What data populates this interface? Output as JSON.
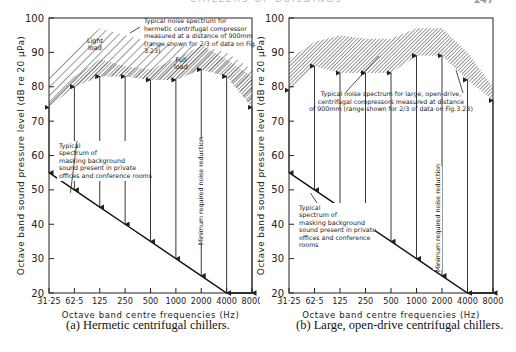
{
  "page": {
    "header_text": "CHILLERS OF BUILDINGS",
    "page_number": "147"
  },
  "chart_data": [
    {
      "type": "line",
      "panel": "a",
      "title": "(a) Hermetic centrifugal chillers.",
      "xlabel": "Octave band centre frequencies (Hz)",
      "ylabel": "Octave band sound pressure level (dB re 20 μPa)",
      "ylim": [
        20,
        100
      ],
      "yticks": [
        20,
        30,
        40,
        50,
        60,
        70,
        80,
        90,
        100
      ],
      "categories": [
        "31·25",
        "62·5",
        "125",
        "250",
        "500",
        "1000",
        "2000",
        "4000",
        "8000"
      ],
      "series": [
        {
          "name": "Light load noise spectrum (upper bound)",
          "values": [
            83,
            91,
            97,
            95,
            93,
            92,
            92,
            90,
            85
          ]
        },
        {
          "name": "Full load noise spectrum (upper bound)",
          "values": [
            76,
            83,
            88,
            86,
            85,
            88,
            92,
            88,
            83
          ]
        },
        {
          "name": "Full load noise spectrum (lower bound, arrow tips)",
          "values": [
            74,
            80,
            83,
            83,
            82,
            82,
            85,
            83,
            74
          ]
        },
        {
          "name": "Typical spectrum of masking background sound",
          "values": [
            55,
            50,
            45,
            40,
            35,
            30,
            25,
            20,
            20
          ]
        }
      ],
      "annotations": [
        "Typical noise spectrum for hermetic centrifugal compressor measured at a distance of 900mm (range shown for 2/3 of data on Fig. 3.23)",
        "Light load",
        "Full load",
        "Typical spectrum of masking background sound present in private offices and conference rooms",
        "Minimum required noise reduction"
      ],
      "grid": false
    },
    {
      "type": "line",
      "panel": "b",
      "title": "(b) Large, open-drive centrifugal chillers.",
      "xlabel": "Octave band centre frequencies (Hz)",
      "ylabel": "Octave band sound pressure level (dB re 20 μPa)",
      "ylim": [
        20,
        100
      ],
      "yticks": [
        20,
        30,
        40,
        50,
        60,
        70,
        80,
        90,
        100
      ],
      "categories": [
        "31·25",
        "62·5",
        "125",
        "250",
        "500",
        "1000",
        "2000",
        "4000",
        "8000"
      ],
      "series": [
        {
          "name": "Noise spectrum (upper bound)",
          "values": [
            88,
            93,
            95,
            94,
            94,
            97,
            97,
            90,
            80
          ]
        },
        {
          "name": "Noise spectrum (lower bound, arrow tips)",
          "values": [
            79,
            86,
            84,
            84,
            84,
            89,
            89,
            82,
            76
          ]
        },
        {
          "name": "Typical spectrum of masking background sound",
          "values": [
            55,
            50,
            45,
            40,
            35,
            30,
            25,
            20,
            20
          ]
        }
      ],
      "annotations": [
        "Typical noise spectrum for large, open-drive, centrifugal compressors measured at distance of 900mm (range shown for 2/3 of data on Fig.3.23)",
        "Typical spectrum of masking background sound present in private offices and conference rooms",
        "Minimum required noise reduction"
      ],
      "grid": false
    }
  ],
  "labels": {
    "a": {
      "noise_note": [
        "Typical noise spectrum for",
        "hermetic centrifugal compressor",
        "measured at a distance of 900mm",
        "(range shown for 2/3 of data on Fig.",
        "3.23)"
      ],
      "light_load": [
        "Light",
        "load"
      ],
      "full_load": [
        "Full",
        "load"
      ],
      "background_note": [
        "Typical",
        "spectrum of",
        "masking background",
        "sound present in private",
        "offices and conference rooms"
      ],
      "min_reduction": "Minimum required noise reduction"
    },
    "b": {
      "noise_note": [
        "Typical noise spectrum for large, open-drive,",
        "centrifugal compressors measured at distance",
        "of 900mm (range shown for 2/3 of data on Fig.3.23)"
      ],
      "background_note": [
        "Typical",
        "spectrum of",
        "masking background",
        "sound present in private",
        "offices and conference",
        "rooms"
      ],
      "min_reduction": "Minimum required noise reduction"
    }
  }
}
